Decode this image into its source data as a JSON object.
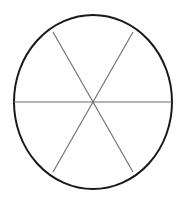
{
  "figure": {
    "background_color": "#ffffff",
    "width": 187,
    "height": 203
  },
  "chart_data": {
    "type": "pie",
    "subtitle": "",
    "xlabel": "",
    "ylabel": "",
    "categories": [
      "sector-1",
      "sector-2",
      "sector-3",
      "sector-4",
      "sector-5",
      "sector-6"
    ],
    "values": [
      60,
      60,
      60,
      60,
      60,
      60
    ],
    "value_unit": "degrees",
    "slice_count": 6,
    "slice_angle_degrees": 60,
    "slices_equal": true,
    "slice_fill": "none",
    "data_labels_shown": false,
    "tick_labels": [],
    "legend_entries": [],
    "legend_position": "none",
    "grid": false,
    "annotations": []
  },
  "geometry": {
    "center": {
      "x": 93,
      "y": 102
    },
    "radius_x": 79,
    "radius_y": 87,
    "outline": {
      "color": "#1a1a1a",
      "stroke_width": 2
    },
    "dividers": {
      "color": "#6b6b6b",
      "stroke_width": 1,
      "count": 3,
      "angles_degrees": [
        0,
        60,
        120
      ],
      "lines": [
        {
          "name": "horizontal-diameter",
          "angle_degrees": 0,
          "x1": 14,
          "y1": 102,
          "x2": 172,
          "y2": 102
        },
        {
          "name": "diagonal-diameter-upper-left-to-lower-right",
          "angle_degrees": 60,
          "x1": 53,
          "y1": 32,
          "x2": 133,
          "y2": 172
        },
        {
          "name": "diagonal-diameter-upper-right-to-lower-left",
          "angle_degrees": 120,
          "x1": 133,
          "y1": 32,
          "x2": 53,
          "y2": 172
        }
      ]
    },
    "endpoints": [
      {
        "name": "left-vertex",
        "x": 14,
        "y": 102
      },
      {
        "name": "right-vertex",
        "x": 172,
        "y": 102
      },
      {
        "name": "upper-left-vertex",
        "x": 53,
        "y": 32
      },
      {
        "name": "upper-right-vertex",
        "x": 133,
        "y": 32
      },
      {
        "name": "lower-left-vertex",
        "x": 53,
        "y": 172
      },
      {
        "name": "lower-right-vertex",
        "x": 133,
        "y": 172
      }
    ]
  }
}
